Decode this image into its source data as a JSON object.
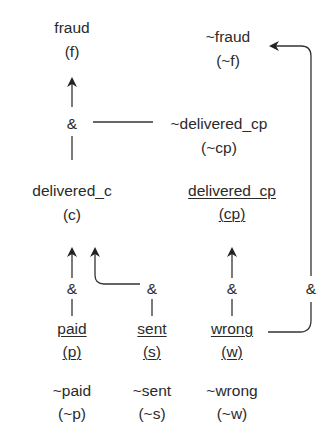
{
  "nodes": {
    "fraud": {
      "name": "fraud",
      "abbr": "(f)"
    },
    "not_fraud": {
      "name": "~fraud",
      "abbr": "(~f)"
    },
    "not_delivered_cp": {
      "name": "~delivered_cp",
      "abbr": "(~cp)"
    },
    "delivered_c": {
      "name": "delivered_c",
      "abbr": "(c)"
    },
    "delivered_cp": {
      "name": "delivered_cp",
      "abbr": "(cp)",
      "underlined": true
    },
    "paid": {
      "name": "paid",
      "abbr": "(p)",
      "underlined": true
    },
    "sent": {
      "name": "sent",
      "abbr": "(s)",
      "underlined": true
    },
    "wrong": {
      "name": "wrong",
      "abbr": "(w)",
      "underlined": true
    },
    "not_paid": {
      "name": "~paid",
      "abbr": "(~p)"
    },
    "not_sent": {
      "name": "~sent",
      "abbr": "(~s)"
    },
    "not_wrong": {
      "name": "~wrong",
      "abbr": "(~w)"
    }
  },
  "operators": {
    "and_fraud": "&",
    "and_delivered_c_paid": "&",
    "and_delivered_c_sent": "&",
    "and_delivered_cp": "&",
    "and_not_fraud": "&"
  },
  "edges": [
    {
      "from": "and_fraud",
      "to": "fraud"
    },
    {
      "from": "not_delivered_cp",
      "to": "and_fraud"
    },
    {
      "from": "delivered_c",
      "to": "and_fraud"
    },
    {
      "from": "and_delivered_c_paid",
      "to": "delivered_c"
    },
    {
      "from": "and_delivered_c_sent",
      "to": "delivered_c"
    },
    {
      "from": "paid",
      "to": "and_delivered_c_paid"
    },
    {
      "from": "sent",
      "to": "and_delivered_c_sent"
    },
    {
      "from": "and_delivered_cp",
      "to": "delivered_cp"
    },
    {
      "from": "wrong",
      "to": "and_delivered_cp"
    },
    {
      "from": "wrong",
      "to": "and_not_fraud"
    },
    {
      "from": "and_not_fraud",
      "to": "not_fraud"
    }
  ]
}
